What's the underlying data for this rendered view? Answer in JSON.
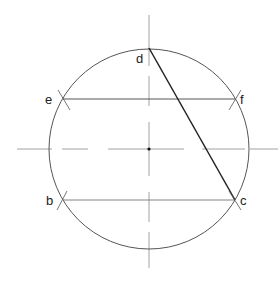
{
  "diagram": {
    "colors": {
      "stroke": "#555555",
      "chord_dc": "#222222",
      "centerline": "#999999",
      "label": "#222222"
    },
    "circle": {
      "cx": 149,
      "cy": 149,
      "r": 100
    },
    "labels": {
      "d": "d",
      "e": "e",
      "f": "f",
      "b": "b",
      "c": "c"
    },
    "points": {
      "d": [
        149,
        48
      ],
      "e": [
        63,
        99
      ],
      "f": [
        235,
        99
      ],
      "b": [
        63,
        200
      ],
      "c": [
        235,
        200
      ],
      "center": [
        149,
        149
      ]
    }
  }
}
